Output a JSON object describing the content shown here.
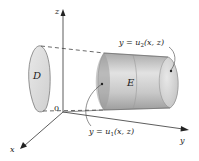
{
  "figure": {
    "type": "3D region diagram",
    "axes": {
      "x_label": "x",
      "y_label": "y",
      "z_label": "z",
      "origin_label": "0"
    },
    "regions": {
      "projection_label": "D",
      "solid_label": "E"
    },
    "surfaces": {
      "upper_label_main": "y = u",
      "upper_label_sub": "2",
      "upper_label_args": "(x, z)",
      "lower_label_main": "y = u",
      "lower_label_sub": "1",
      "lower_label_args": "(x, z)"
    },
    "colors": {
      "axis": "#333333",
      "region_fill": "#d9d9d9",
      "solid_fill": "#bdbdbd",
      "solid_highlight": "#e6e6e6",
      "dashed": "#444444"
    }
  }
}
